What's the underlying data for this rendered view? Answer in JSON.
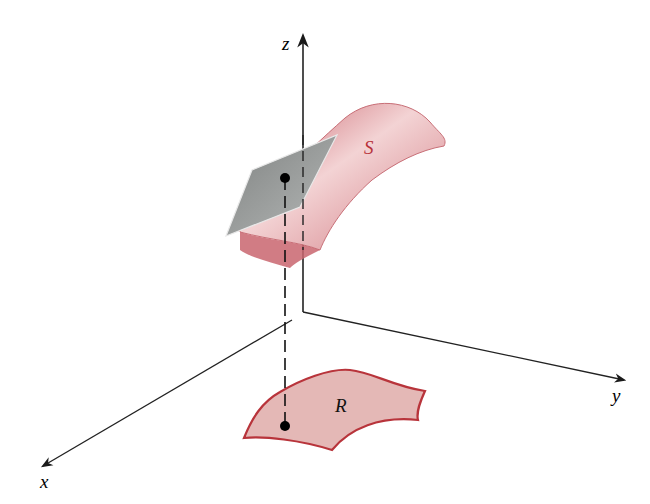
{
  "figure": {
    "axes": {
      "x_label": "x",
      "y_label": "y",
      "z_label": "z"
    },
    "surface_label": "S",
    "region_label": "R",
    "colors": {
      "surface": "#d98a8f",
      "surface_edge": "#b94a52",
      "region_fill": "#e6b7b5",
      "region_edge": "#b8343b",
      "tangent_plane": "#9a9d9c",
      "axis": "#222222"
    }
  }
}
